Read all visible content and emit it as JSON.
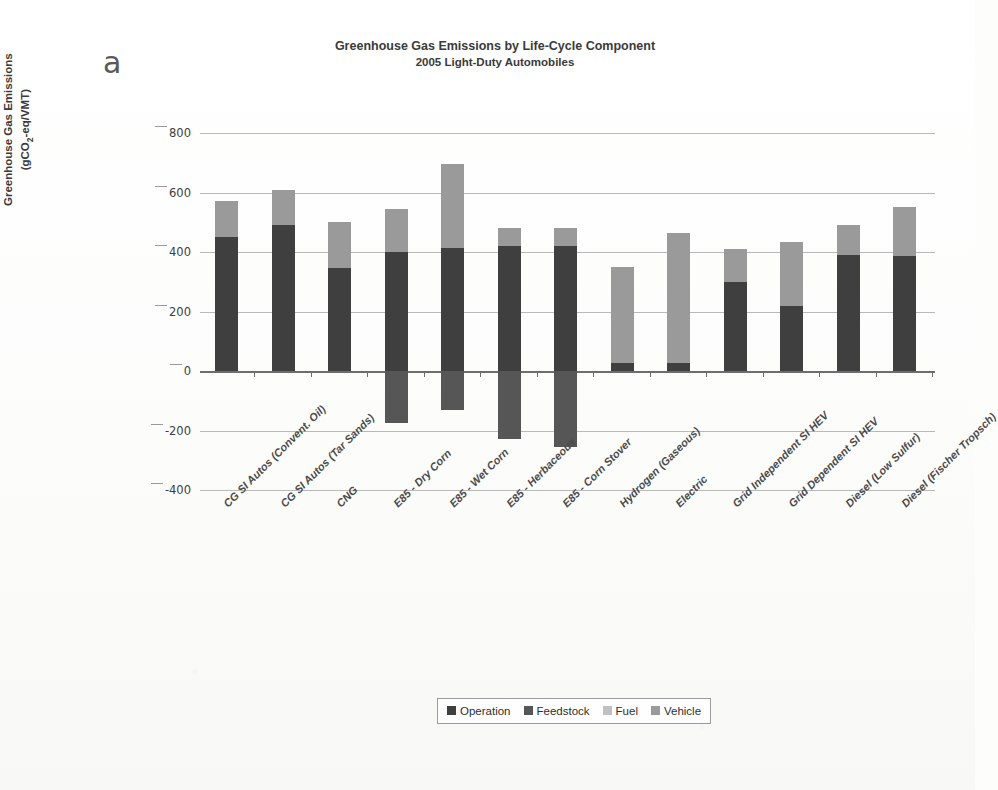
{
  "panel_label": "a",
  "title": {
    "line1": "Greenhouse Gas Emissions by Life-Cycle Component",
    "line2": "2005 Light-Duty Automobiles"
  },
  "axis": {
    "ylabel_line1": "Greenhouse Gas Emissions",
    "ylabel_line2_pre": "(gCO",
    "ylabel_line2_sub": "2",
    "ylabel_line2_post": "-eq/VMT)",
    "yticks": [
      800,
      600,
      400,
      200,
      0,
      -200,
      -400
    ]
  },
  "legend": {
    "items": [
      {
        "label": "Operation",
        "color": "#3f3f3f"
      },
      {
        "label": "Feedstock",
        "color": "#565656"
      },
      {
        "label": "Fuel",
        "color": "#c0c0c0"
      },
      {
        "label": "Vehicle",
        "color": "#9a9a9a"
      }
    ]
  },
  "chart_data": {
    "type": "bar",
    "subtype": "stacked-bar-with-negative",
    "xlabel": "",
    "ylabel": "Greenhouse Gas Emissions (gCO2-eq/VMT)",
    "ylim": [
      -400,
      800
    ],
    "ytick_step": 200,
    "grid": true,
    "legend_position": "bottom-center",
    "categories": [
      "CG SI Autos (Convent. Oil)",
      "CG SI Autos (Tar Sands)",
      "CNG",
      "E85 - Dry Corn",
      "E85 - Wet Corn",
      "E85 - Herbaceous",
      "E85 - Corn Stover",
      "Hydrogen (Gaseous)",
      "Electric",
      "Grid Independent SI HEV",
      "Grid Dependent SI HEV",
      "Diesel (Low Sulfur)",
      "Diesel (Fischer Tropsch)"
    ],
    "series": [
      {
        "name": "Operation",
        "color": "#3f3f3f",
        "values": [
          450,
          490,
          345,
          400,
          412,
          420,
          420,
          28,
          28,
          300,
          220,
          390,
          385
        ]
      },
      {
        "name": "Feedstock",
        "color": "#565656",
        "values": [
          0,
          0,
          0,
          -175,
          -130,
          -230,
          -255,
          0,
          0,
          0,
          0,
          0,
          0
        ]
      },
      {
        "name": "Fuel + Vehicle",
        "color": "#9a9a9a",
        "values": [
          120,
          120,
          155,
          145,
          283,
          60,
          60,
          322,
          437,
          110,
          215,
          100,
          165
        ]
      }
    ],
    "bar_totals_positive": [
      570,
      610,
      500,
      545,
      695,
      480,
      480,
      350,
      465,
      410,
      435,
      490,
      550
    ],
    "bar_totals_negative": [
      0,
      0,
      0,
      -175,
      -130,
      -230,
      -255,
      0,
      0,
      0,
      0,
      0,
      0
    ]
  }
}
